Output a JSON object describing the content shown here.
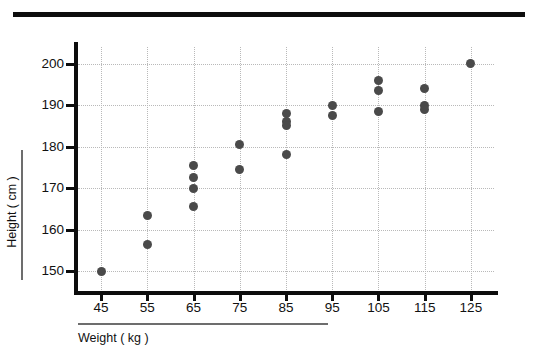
{
  "figure": {
    "has_top_rule": true,
    "marker_color": "#4a4a4a",
    "gridline_color": "#b9b9b9",
    "axis_color": "#0d0d0d"
  },
  "chart_data": {
    "type": "scatter",
    "title": "",
    "xlabel": "Weight ( kg )",
    "ylabel": "Height ( cm )",
    "xlim": [
      40,
      130
    ],
    "ylim": [
      145,
      204
    ],
    "xticks": [
      45,
      55,
      65,
      75,
      85,
      95,
      105,
      115,
      125
    ],
    "yticks": [
      150,
      160,
      170,
      180,
      190,
      200
    ],
    "xtick_labels": [
      "45",
      "55",
      "65",
      "75",
      "85",
      "95",
      "105",
      "115",
      "125"
    ],
    "ytick_labels": [
      "150",
      "160",
      "170",
      "180",
      "190",
      "200"
    ],
    "grid": true,
    "legend": null,
    "points": [
      {
        "x": 45,
        "y": 150.0
      },
      {
        "x": 55,
        "y": 163.5
      },
      {
        "x": 55,
        "y": 156.5
      },
      {
        "x": 65,
        "y": 175.5
      },
      {
        "x": 65,
        "y": 172.5
      },
      {
        "x": 65,
        "y": 170.0
      },
      {
        "x": 65,
        "y": 165.5
      },
      {
        "x": 75,
        "y": 180.5
      },
      {
        "x": 75,
        "y": 174.5
      },
      {
        "x": 85,
        "y": 188.0
      },
      {
        "x": 85,
        "y": 186.0
      },
      {
        "x": 85,
        "y": 185.0
      },
      {
        "x": 85,
        "y": 178.0
      },
      {
        "x": 95,
        "y": 190.0
      },
      {
        "x": 95,
        "y": 187.5
      },
      {
        "x": 105,
        "y": 196.0
      },
      {
        "x": 105,
        "y": 193.5
      },
      {
        "x": 105,
        "y": 188.5
      },
      {
        "x": 115,
        "y": 194.0
      },
      {
        "x": 115,
        "y": 190.0
      },
      {
        "x": 115,
        "y": 189.0
      },
      {
        "x": 125,
        "y": 200.0
      }
    ]
  }
}
